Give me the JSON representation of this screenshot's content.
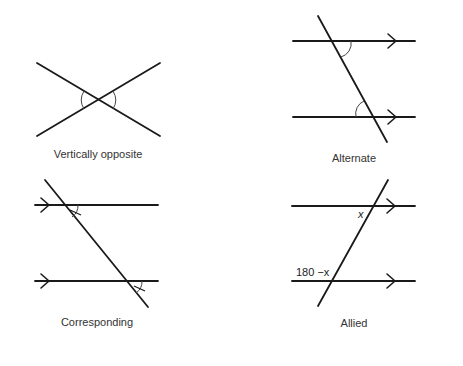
{
  "colors": {
    "background": "#ffffff",
    "line": "#1a1a1a",
    "text": "#333333"
  },
  "panels": [
    {
      "id": "vertically-opposite",
      "caption": "Vertically opposite",
      "description": "Two straight lines crossing; the pair of opposite angles on left and right are marked with arcs"
    },
    {
      "id": "alternate",
      "caption": "Alternate",
      "description": "Two parallel lines (arrows pointing right) cut by a transversal; alternate interior angles marked with arcs"
    },
    {
      "id": "corresponding",
      "caption": "Corresponding",
      "description": "Two parallel lines (arrows on the left pointing right) cut by a transversal; corresponding angles marked with arcs and tick marks"
    },
    {
      "id": "allied",
      "caption": "Allied",
      "description": "Two parallel lines (arrows pointing right) cut by a transversal; co-interior angles labelled x and 180 −x",
      "labels": {
        "upper_angle": "x",
        "lower_angle": "180 −x"
      }
    }
  ]
}
